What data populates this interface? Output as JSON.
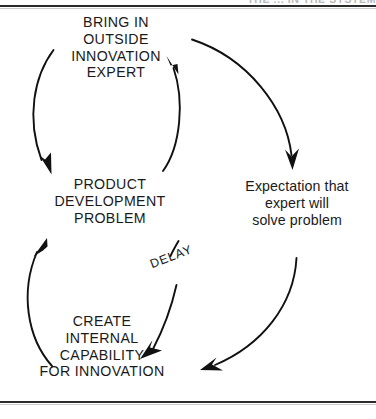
{
  "figure": {
    "clipped_header_fragment": "THE ... IN THE SYSTEM",
    "background_color": "#ffffff",
    "line_color": "#111111",
    "text_color": "#1a1a1a",
    "rule_color": "#2b2b2b"
  },
  "nodes": [
    {
      "id": "bring-in-outside-innovation-expert",
      "label": "BRING IN\nOUTSIDE\nINNOVATION\nEXPERT",
      "case": "uppercase"
    },
    {
      "id": "product-development-problem",
      "label": "PRODUCT\nDEVELOPMENT\nPROBLEM",
      "case": "uppercase"
    },
    {
      "id": "expectation-that-expert-will-solve-problem",
      "label": "Expectation that\nexpert will\nsolve problem",
      "case": "sentence"
    },
    {
      "id": "create-internal-capability-for-innovation",
      "label": "CREATE\nINTERNAL\nCAPABILITY\nFOR INNOVATION",
      "case": "uppercase"
    }
  ],
  "annotations": {
    "delay": "DELAY"
  },
  "links": [
    {
      "id": "bring-in-to-product",
      "from": "bring-in-outside-innovation-expert",
      "to": "product-development-problem",
      "style": "curved-arrow",
      "side": "left"
    },
    {
      "id": "product-to-bring-in",
      "from": "product-development-problem",
      "to": "bring-in-outside-innovation-expert",
      "style": "curved-arrow",
      "side": "inner-right"
    },
    {
      "id": "bring-in-to-expectation",
      "from": "bring-in-outside-innovation-expert",
      "to": "expectation-that-expert-will-solve-problem",
      "style": "curved-arrow",
      "side": "outer-right"
    },
    {
      "id": "expectation-to-create-internal",
      "from": "expectation-that-expert-will-solve-problem",
      "to": "create-internal-capability-for-innovation",
      "style": "curved-arrow",
      "side": "outer-bottom-right"
    },
    {
      "id": "product-to-create-internal",
      "from": "product-development-problem",
      "to": "create-internal-capability-for-innovation",
      "style": "curved-arrow-with-delay",
      "side": "inner-bottom",
      "annotation": "DELAY"
    },
    {
      "id": "create-internal-to-product",
      "from": "create-internal-capability-for-innovation",
      "to": "product-development-problem",
      "style": "curved-arrow",
      "side": "outer-left"
    }
  ]
}
